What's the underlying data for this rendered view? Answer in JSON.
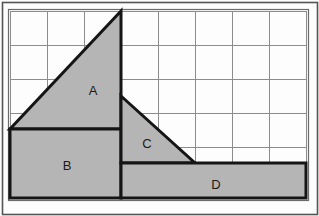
{
  "figure": {
    "canvas": {
      "width": 319,
      "height": 216
    },
    "colors": {
      "page_background": "#fdfdfd",
      "outer_frame": "#555555",
      "inner_frame": "#6b6b6b",
      "grid_line": "#8c8c8c",
      "shape_fill": "#b5b5b5",
      "shape_outline": "#151515",
      "label_text": "#1a1a1a"
    },
    "grid": {
      "origin_x": 10,
      "origin_y": 11,
      "cell_width": 37,
      "cell_height": 34,
      "columns": 8,
      "rows": 5,
      "right_x": 306,
      "bottom_y": 198,
      "x_lines": [
        10,
        47,
        84,
        121,
        158,
        195,
        232,
        269,
        306
      ],
      "y_lines": [
        11,
        45,
        79,
        113,
        147,
        181,
        198
      ]
    },
    "frame": {
      "outer": {
        "x": 2,
        "y": 2,
        "width": 315,
        "height": 212
      },
      "inner": {
        "x": 8,
        "y": 9,
        "width": 300,
        "height": 191
      }
    },
    "shapes": [
      {
        "id": "A",
        "label": "A",
        "type": "triangle",
        "points": "10,129 121,129 121,11",
        "label_x": 93,
        "label_y": 92
      },
      {
        "id": "B",
        "label": "B",
        "type": "rectangle",
        "points": "10,129 121,129 121,198 10,198",
        "label_x": 67,
        "label_y": 167
      },
      {
        "id": "C",
        "label": "C",
        "type": "triangle",
        "points": "121,96 195,163 121,163",
        "label_x": 147,
        "label_y": 145
      },
      {
        "id": "D",
        "label": "D",
        "type": "rectangle",
        "points": "121,163 306,163 306,198 121,198",
        "label_x": 216,
        "label_y": 186
      }
    ]
  }
}
